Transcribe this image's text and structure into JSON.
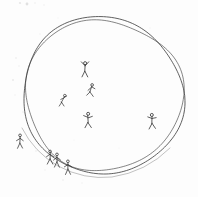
{
  "artwork": {
    "title": "Hand-drawn circle with stick figures",
    "medium": "pencil sketch on white paper",
    "caption": "",
    "background_color": "#fdfdfd",
    "ink_color": "#3a3a3a",
    "faint_ink_color": "#9a9a9a"
  },
  "circle": {
    "label": "large hand-drawn circle",
    "stroke_color": "#3d3d3d",
    "stroke_width": 1.0,
    "passes": 2,
    "center_x": 101,
    "center_y": 96,
    "radius_x": 80,
    "radius_y": 80
  },
  "figures": [
    {
      "id": "figure-arms-raised",
      "label": "stick figure with arms raised",
      "x": 85,
      "y": 70,
      "scale": 1.0,
      "pose": "arms-raised"
    },
    {
      "id": "figure-running-upper",
      "label": "stick figure running",
      "x": 91,
      "y": 91,
      "scale": 0.95,
      "pose": "running"
    },
    {
      "id": "figure-leaning-left",
      "label": "small stick figure leaning",
      "x": 63,
      "y": 101,
      "scale": 0.9,
      "pose": "leaning"
    },
    {
      "id": "figure-center",
      "label": "stick figure standing center",
      "x": 88,
      "y": 121,
      "scale": 1.0,
      "pose": "arms-out"
    },
    {
      "id": "figure-right",
      "label": "stick figure standing right",
      "x": 152,
      "y": 122,
      "scale": 1.0,
      "pose": "arms-out"
    },
    {
      "id": "figure-outside-left",
      "label": "stick figure outside circle at left",
      "x": 20,
      "y": 142,
      "scale": 0.95,
      "pose": "standing"
    },
    {
      "id": "figure-on-line-a",
      "label": "stick figure standing on the circle line",
      "x": 50,
      "y": 158,
      "scale": 0.95,
      "pose": "standing"
    },
    {
      "id": "figure-on-line-b",
      "label": "stick figure standing on the circle line",
      "x": 57,
      "y": 161,
      "scale": 0.95,
      "pose": "standing"
    },
    {
      "id": "figure-on-line-c",
      "label": "stick figure standing on the circle line",
      "x": 68,
      "y": 168,
      "scale": 0.95,
      "pose": "standing"
    }
  ],
  "speckles": [
    {
      "x": 27,
      "y": 4,
      "r": 1.4,
      "o": 0.28
    },
    {
      "x": 20,
      "y": 3,
      "r": 1.1,
      "o": 0.22
    },
    {
      "x": 35,
      "y": 3,
      "r": 0.8,
      "o": 0.16
    },
    {
      "x": 44,
      "y": 5,
      "r": 0.7,
      "o": 0.14
    },
    {
      "x": 16,
      "y": 58,
      "r": 0.8,
      "o": 0.2
    },
    {
      "x": 19,
      "y": 66,
      "r": 0.7,
      "o": 0.18
    },
    {
      "x": 13,
      "y": 80,
      "r": 0.9,
      "o": 0.2
    },
    {
      "x": 15,
      "y": 95,
      "r": 0.7,
      "o": 0.16
    },
    {
      "x": 23,
      "y": 112,
      "r": 0.8,
      "o": 0.18
    },
    {
      "x": 40,
      "y": 34,
      "r": 0.7,
      "o": 0.15
    },
    {
      "x": 58,
      "y": 18,
      "r": 0.6,
      "o": 0.13
    },
    {
      "x": 36,
      "y": 151,
      "r": 0.8,
      "o": 0.18
    },
    {
      "x": 45,
      "y": 170,
      "r": 0.7,
      "o": 0.16
    },
    {
      "x": 63,
      "y": 180,
      "r": 0.8,
      "o": 0.18
    },
    {
      "x": 82,
      "y": 183,
      "r": 0.7,
      "o": 0.15
    },
    {
      "x": 99,
      "y": 176,
      "r": 0.6,
      "o": 0.13
    },
    {
      "x": 128,
      "y": 170,
      "r": 0.7,
      "o": 0.15
    },
    {
      "x": 141,
      "y": 162,
      "r": 0.6,
      "o": 0.13
    },
    {
      "x": 170,
      "y": 140,
      "r": 0.7,
      "o": 0.14
    },
    {
      "x": 184,
      "y": 112,
      "r": 0.8,
      "o": 0.17
    },
    {
      "x": 176,
      "y": 60,
      "r": 0.6,
      "o": 0.12
    },
    {
      "x": 150,
      "y": 28,
      "r": 0.7,
      "o": 0.13
    },
    {
      "x": 119,
      "y": 148,
      "r": 0.6,
      "o": 0.12
    },
    {
      "x": 74,
      "y": 140,
      "r": 0.6,
      "o": 0.12
    }
  ]
}
